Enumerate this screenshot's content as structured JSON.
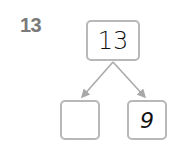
{
  "problem": {
    "number": "13",
    "whole": "13",
    "parts": [
      {
        "value": ""
      },
      {
        "value": "9"
      }
    ]
  },
  "colors": {
    "border": "#b8b8b8",
    "label": "#7a7a7a",
    "arrow": "#a8a8a8"
  }
}
